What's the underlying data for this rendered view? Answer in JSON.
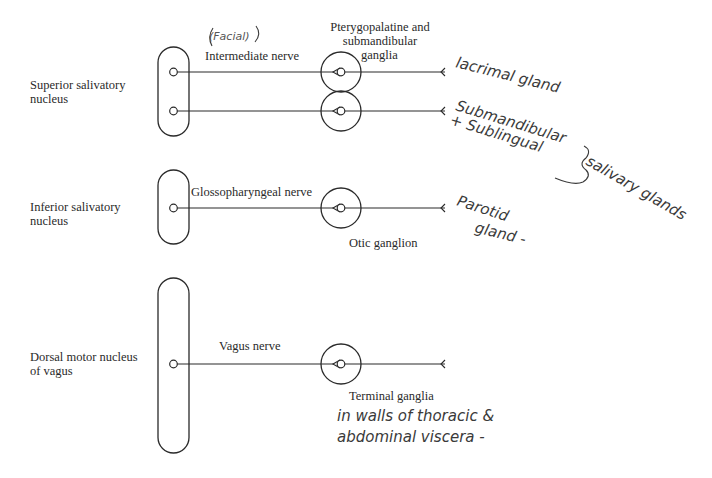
{
  "diagram": {
    "type": "parasympathetic-cranial-outflow-salivary",
    "nuclei": [
      {
        "id": "superior-salivatory",
        "label_lines": [
          "Superior salivatory",
          "nucleus"
        ]
      },
      {
        "id": "inferior-salivatory",
        "label_lines": [
          "Inferior salivatory",
          "nucleus"
        ]
      },
      {
        "id": "dorsal-motor-vagus",
        "label_lines": [
          "Dorsal motor nucleus",
          "of vagus"
        ]
      }
    ],
    "nerves": [
      {
        "id": "intermediate",
        "label": "Intermediate nerve",
        "annotation": "(Facial)"
      },
      {
        "id": "glossopharyngeal",
        "label": "Glossopharyngeal nerve"
      },
      {
        "id": "vagus",
        "label": "Vagus nerve"
      }
    ],
    "ganglia": [
      {
        "id": "pterygopalatine-submandibular",
        "label_lines": [
          "Pterygopalatine and",
          "submandibular",
          "ganglia"
        ]
      },
      {
        "id": "otic",
        "label": "Otic ganglion"
      },
      {
        "id": "terminal",
        "label": "Terminal ganglia",
        "annotation_lines": [
          "in walls of thoracic &",
          "abdominal viscera -"
        ]
      }
    ],
    "targets": [
      {
        "id": "lacrimal",
        "label": "lacrimal gland"
      },
      {
        "id": "submandibular-sublingual",
        "label_lines": [
          "Submandibular",
          "+ Sublingual"
        ]
      },
      {
        "id": "salivary-group",
        "label": "salivary glands"
      },
      {
        "id": "parotid",
        "label_lines": [
          "Parotid",
          "gland -"
        ]
      }
    ]
  }
}
